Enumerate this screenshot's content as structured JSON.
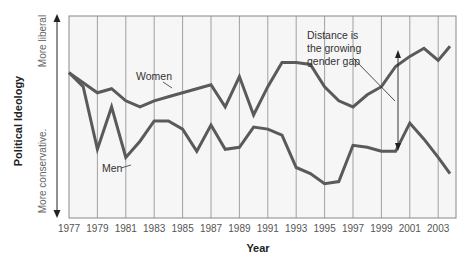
{
  "chart_data": {
    "type": "line",
    "title": "",
    "xlabel": "Year",
    "ylabel": "Political Ideology",
    "y_axis_ends": {
      "top": "More liberal",
      "bottom": "More conservative."
    },
    "x_ticks": [
      "1977",
      "1979",
      "1981",
      "1983",
      "1985",
      "1987",
      "1989",
      "1991",
      "1993",
      "1995",
      "1997",
      "1999",
      "2001",
      "2003"
    ],
    "xlim": [
      1977,
      2004
    ],
    "ylim": [
      0,
      100
    ],
    "y_units": "relative liberalism (0 = most conservative, 100 = most liberal; estimated from pixel positions)",
    "grid": {
      "vertical": true,
      "horizontal": false
    },
    "legend": "inline labels",
    "x": [
      1977,
      1978,
      1979,
      1980,
      1981,
      1982,
      1983,
      1984,
      1985,
      1986,
      1987,
      1988,
      1989,
      1990,
      1991,
      1992,
      1993,
      1994,
      1995,
      1996,
      1997,
      1998,
      1999,
      2000,
      2001,
      2002,
      2003,
      2004
    ],
    "series": [
      {
        "name": "Women",
        "color": "#5a5a5a",
        "values": [
          72,
          67,
          62,
          64,
          58,
          55,
          58,
          60,
          62,
          64,
          66,
          55,
          70,
          51,
          65,
          77,
          77,
          76,
          65,
          58,
          55,
          61,
          65,
          75,
          80,
          84,
          78,
          85
        ]
      },
      {
        "name": "Men",
        "color": "#5a5a5a",
        "values": [
          72,
          65,
          34,
          55,
          30,
          38,
          48,
          48,
          44,
          33,
          46,
          34,
          35,
          45,
          44,
          41,
          25,
          22,
          17,
          18,
          36,
          35,
          33,
          33,
          47,
          39,
          30,
          22
        ]
      }
    ],
    "annotations": [
      {
        "text": "Women",
        "points_to": "Women line near 1985"
      },
      {
        "text": "Men",
        "points_to": "Men line near 1982"
      },
      {
        "text": "Distance is the growing gender gap",
        "lines": [
          "Distance is",
          "the growing",
          "gender gap"
        ],
        "points_to": "double-headed arrow between lines near 2000"
      }
    ]
  }
}
